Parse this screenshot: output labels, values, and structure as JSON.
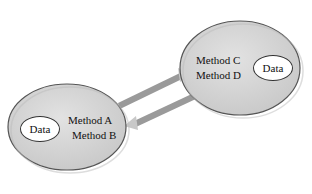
{
  "objects": [
    {
      "id": "object-left",
      "data_label": "Data",
      "methods": [
        "Method A",
        "Method B"
      ]
    },
    {
      "id": "object-right",
      "data_label": "Data",
      "methods": [
        "Method C",
        "Method D"
      ]
    }
  ],
  "arrows": [
    {
      "from": "object-left",
      "to": "object-right",
      "direction": "message-send"
    },
    {
      "from": "object-right",
      "to": "object-left",
      "direction": "message-return"
    }
  ],
  "colors": {
    "object_fill": "#d4d4d4",
    "object_stroke": "#555555",
    "arrow": "#9a9a9a",
    "data_fill": "#ffffff"
  }
}
